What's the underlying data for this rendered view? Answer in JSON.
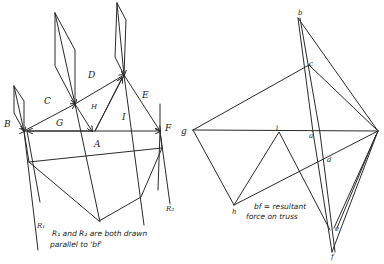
{
  "space_diagram": {
    "labels": {
      "B": "B",
      "C": "C",
      "D": "D",
      "E": "E",
      "F": "F",
      "G": "G",
      "H": "H",
      "I": "I",
      "A": "A",
      "R1": "R₁",
      "R2": "R₂"
    },
    "note_line1": "R₁ and R₂ are both drawn",
    "note_line2": "parallel to 'bf'"
  },
  "force_diagram": {
    "labels": {
      "b": "b",
      "c": "c",
      "g": "g",
      "i": "i",
      "a": "a",
      "d": "d",
      "h": "h",
      "e": "e",
      "f": "f"
    },
    "note_line1": "bf = resultant",
    "note_line2": "force on truss"
  },
  "colors": {
    "ink": "#2a2a2a",
    "paper": "#ffffff"
  }
}
